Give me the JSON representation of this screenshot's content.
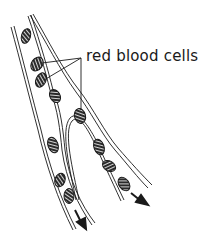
{
  "diagram": {
    "label": "red blood cells",
    "colors": {
      "ink": "#1a1a1a",
      "cell_fill": "#2a2a2a",
      "background": "#ffffff"
    },
    "parts": {
      "vessel": "branching blood vessel (double-walled)",
      "cells": "red blood cells (hatched ovals)",
      "arrows": "direction of flow"
    },
    "cell_count": 11,
    "flow_arrow_count": 2
  }
}
